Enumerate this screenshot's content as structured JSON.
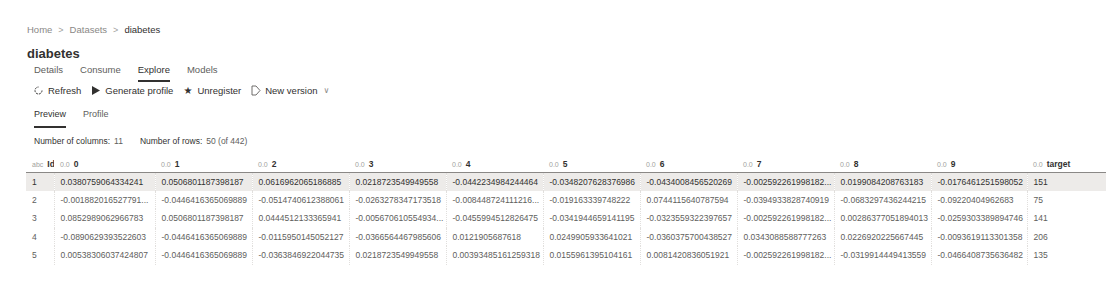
{
  "breadcrumb": {
    "items": [
      "Home",
      "Datasets",
      "diabetes"
    ],
    "separator": ">"
  },
  "title": "diabetes",
  "tabs": [
    {
      "label": "Details",
      "active": false
    },
    {
      "label": "Consume",
      "active": false
    },
    {
      "label": "Explore",
      "active": true
    },
    {
      "label": "Models",
      "active": false
    }
  ],
  "toolbar": {
    "refresh_label": "Refresh",
    "refresh_icon": "refresh-icon",
    "generate_profile_label": "Generate profile",
    "generate_profile_icon": "play-icon",
    "unregister_label": "Unregister",
    "unregister_icon": "star-icon",
    "new_version_label": "New version",
    "new_version_icon": "new-version-icon"
  },
  "subtabs": [
    {
      "label": "Preview",
      "active": true
    },
    {
      "label": "Profile",
      "active": false
    }
  ],
  "counts": {
    "columns_label": "Number of columns:",
    "columns_value": "11",
    "rows_label": "Number of rows:",
    "rows_value": "50 (of 442)"
  },
  "table": {
    "columns": [
      {
        "type": "abc",
        "name": "Id"
      },
      {
        "type": "0.0",
        "name": "0"
      },
      {
        "type": "0.0",
        "name": "1"
      },
      {
        "type": "0.0",
        "name": "2"
      },
      {
        "type": "0.0",
        "name": "3"
      },
      {
        "type": "0.0",
        "name": "4"
      },
      {
        "type": "0.0",
        "name": "5"
      },
      {
        "type": "0.0",
        "name": "6"
      },
      {
        "type": "0.0",
        "name": "7"
      },
      {
        "type": "0.0",
        "name": "8"
      },
      {
        "type": "0.0",
        "name": "9"
      },
      {
        "type": "0.0",
        "name": "target"
      }
    ],
    "rows": [
      [
        "1",
        "0.0380759064334241",
        "0.0506801187398187",
        "0.0616962065186885",
        "0.0218723549949558",
        "-0.0442234984244464",
        "-0.0348207628376986",
        "-0.0434008456520269",
        "-0.002592261998182...",
        "0.0199084208763183",
        "-0.0176461251598052",
        "151"
      ],
      [
        "2",
        "-0.001882016527791...",
        "-0.0446416365069889",
        "-0.0514740612388061",
        "-0.0263278347173518",
        "-0.008448724111216...",
        "-0.019163339748222",
        "0.0744115640787594",
        "-0.0394933828740919",
        "-0.0683297436244215",
        "-0.09220404962683",
        "75"
      ],
      [
        "3",
        "0.0852989062966783",
        "0.0506801187398187",
        "0.0444512133365941",
        "-0.005670610554934...",
        "-0.0455994512826475",
        "-0.0341944659141195",
        "-0.0323559322397657",
        "-0.002592261998182...",
        "0.00286377051894013",
        "-0.0259303389894746",
        "141"
      ],
      [
        "4",
        "-0.0890629393522603",
        "-0.0446416365069889",
        "-0.0115950145052127",
        "-0.0366564467985606",
        "0.0121905687618",
        "0.0249905933641021",
        "-0.0360375700438527",
        "0.0343088588777263",
        "0.0226920225667445",
        "-0.0093619113301358",
        "206"
      ],
      [
        "5",
        "0.00538306037424807",
        "-0.0446416365069889",
        "-0.0363846922044735",
        "0.0218723549949558",
        "0.00393485161259318",
        "0.0155961395104161",
        "0.0081420836051921",
        "-0.002592261998182...",
        "-0.0319914449413559",
        "-0.0466408735636482",
        "135"
      ]
    ],
    "selected_row": 0
  }
}
